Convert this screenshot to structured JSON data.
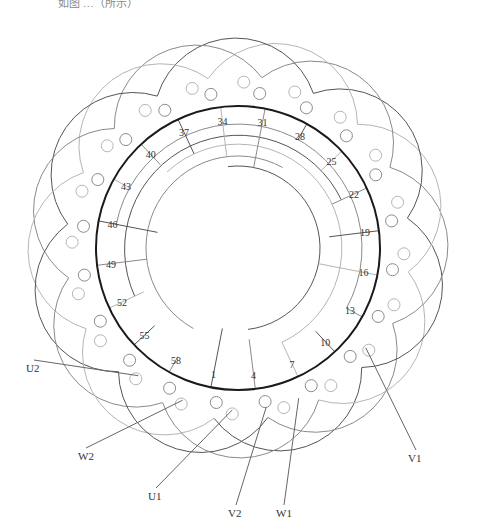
{
  "caption": "如图 …（所示）",
  "diagram": {
    "center": [
      238,
      248
    ],
    "stator_radius": 142,
    "slot_labels": [
      "1",
      "4",
      "7",
      "10",
      "13",
      "16",
      "19",
      "22",
      "25",
      "28",
      "31",
      "34",
      "37",
      "40",
      "43",
      "46",
      "49",
      "52",
      "55",
      "58"
    ],
    "terminals": [
      {
        "label": "U1",
        "x": 148,
        "y": 500
      },
      {
        "label": "V2",
        "x": 228,
        "y": 517
      },
      {
        "label": "W1",
        "x": 276,
        "y": 517
      },
      {
        "label": "V1",
        "x": 408,
        "y": 462
      },
      {
        "label": "W2",
        "x": 78,
        "y": 460
      },
      {
        "label": "U2",
        "x": 26,
        "y": 372
      }
    ],
    "colors": {
      "stator": "#1a1a1a",
      "phase_dark": "#555555",
      "phase_mid": "#8a8a8a",
      "phase_light": "#b5b5b5"
    }
  }
}
